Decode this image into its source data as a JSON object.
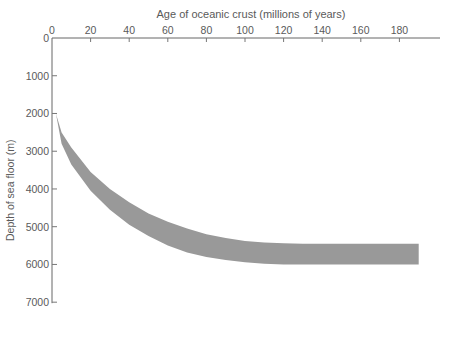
{
  "chart_data": {
    "type": "area",
    "title": "Age of oceanic crust (millions of years)",
    "xlabel": "Age of oceanic crust (millions of years)",
    "ylabel": "Depth of sea floor (m)",
    "x_ticks": [
      0,
      20,
      40,
      60,
      80,
      100,
      120,
      140,
      160,
      180
    ],
    "y_ticks": [
      0,
      1000,
      2000,
      3000,
      4000,
      5000,
      6000,
      7000
    ],
    "xlim": [
      0,
      200
    ],
    "ylim": [
      0,
      7000
    ],
    "y_inverted": true,
    "x_axis_position": "top",
    "grid": false,
    "legend": null,
    "band_color": "#999999",
    "series": [
      {
        "name": "Upper bound depth",
        "x": [
          2,
          5,
          10,
          20,
          30,
          40,
          50,
          60,
          70,
          80,
          90,
          100,
          110,
          120,
          130,
          140,
          160,
          180,
          190
        ],
        "values": [
          2000,
          2500,
          2900,
          3550,
          4000,
          4350,
          4650,
          4870,
          5050,
          5200,
          5300,
          5380,
          5420,
          5440,
          5450,
          5450,
          5450,
          5450,
          5450
        ]
      },
      {
        "name": "Lower bound depth",
        "x": [
          2,
          5,
          10,
          20,
          30,
          40,
          50,
          60,
          70,
          80,
          90,
          100,
          110,
          120,
          130,
          140,
          160,
          180,
          190
        ],
        "values": [
          2000,
          2800,
          3350,
          4050,
          4550,
          4950,
          5250,
          5500,
          5680,
          5800,
          5880,
          5940,
          5980,
          6000,
          6000,
          6000,
          6000,
          6000,
          6000
        ]
      }
    ]
  },
  "axes": {
    "x_tick_labels": [
      "0",
      "20",
      "40",
      "60",
      "80",
      "100",
      "120",
      "140",
      "160",
      "180"
    ],
    "y_tick_labels": [
      "0",
      "1000",
      "2000",
      "3000",
      "4000",
      "5000",
      "6000",
      "7000"
    ]
  }
}
